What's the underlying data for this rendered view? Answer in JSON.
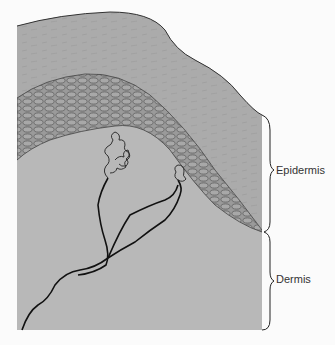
{
  "figure": {
    "labels": {
      "epidermis": "Epidermis",
      "dermis": "Dermis"
    },
    "layers": [
      {
        "name": "stratum-corneum",
        "color": "#a9a9a9"
      },
      {
        "name": "cellular-epidermis",
        "color": "#8f8f8f"
      },
      {
        "name": "dermis",
        "color": "#b9b9b9"
      }
    ],
    "caption_partial": ""
  }
}
